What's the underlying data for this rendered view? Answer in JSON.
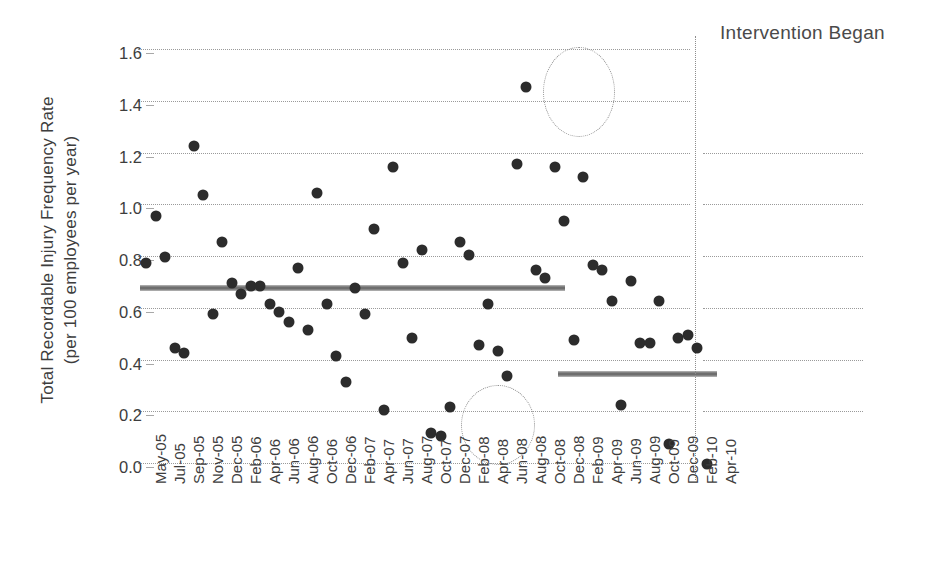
{
  "chart_data": {
    "type": "scatter",
    "title": "",
    "xlabel": "",
    "ylabel_line1": "Total Recordable Injury Frequency Rate",
    "ylabel_line2": "(per 100 employees per year)",
    "ylim": [
      0.0,
      1.6
    ],
    "yticks": [
      0.0,
      0.2,
      0.4,
      0.6,
      0.8,
      1.0,
      1.2,
      1.4,
      1.6
    ],
    "ytick_labels": [
      "0.0",
      "0.2",
      "0.4",
      "0.6",
      "0.8",
      "1.0",
      "1.2",
      "1.4",
      "1.6"
    ],
    "grid": "horizontal-dotted",
    "legend": "none",
    "xtick_labels": [
      "May-05",
      "Jul-05",
      "Sep-05",
      "Nov-05",
      "Dec-05",
      "Feb-06",
      "Apr-06",
      "Jun-06",
      "Aug-06",
      "Oct-06",
      "Dec-06",
      "Feb-07",
      "Apr-07",
      "Jun-07",
      "Aug-07",
      "Oct-07",
      "Dec-07",
      "Feb-08",
      "Apr-08",
      "Jun-08",
      "Aug-08",
      "Oct-08",
      "Dec-08",
      "Feb-09",
      "Apr-09",
      "Jun-09",
      "Aug-09",
      "Oct-09",
      "Dec-09",
      "Feb-10",
      "Apr-10"
    ],
    "x": [
      0,
      1,
      2,
      3,
      4,
      5,
      6,
      7,
      8,
      9,
      10,
      11,
      12,
      13,
      14,
      15,
      16,
      17,
      18,
      19,
      20,
      21,
      22,
      23,
      24,
      25,
      26,
      27,
      28,
      29,
      30,
      31,
      32,
      33,
      34,
      35,
      36,
      37,
      38,
      39,
      40,
      41,
      42,
      43,
      44,
      45,
      46,
      47,
      48,
      49,
      50,
      51,
      52,
      53,
      54,
      55,
      56,
      57,
      58,
      59
    ],
    "values": [
      0.79,
      0.97,
      0.81,
      0.46,
      0.44,
      1.24,
      1.05,
      0.59,
      0.87,
      0.71,
      0.67,
      0.7,
      0.7,
      0.63,
      0.6,
      0.56,
      0.77,
      0.53,
      1.06,
      0.63,
      0.43,
      0.33,
      0.69,
      0.59,
      0.92,
      0.22,
      1.16,
      0.79,
      0.5,
      0.84,
      0.13,
      0.12,
      0.23,
      0.87,
      0.82,
      0.47,
      0.63,
      0.45,
      0.35,
      1.17,
      1.47,
      0.76,
      0.73,
      1.16,
      0.95,
      0.49,
      1.12,
      0.78,
      0.76,
      0.64,
      0.24,
      0.72,
      0.48,
      0.48,
      0.64,
      0.09,
      0.5,
      0.51,
      0.46,
      0.01
    ],
    "series_note": "Monthly total recordable injury frequency rate",
    "mean_lines": [
      {
        "name": "pre-intervention-mean",
        "value": 0.69,
        "x_start": 0,
        "x_end": 43
      },
      {
        "name": "post-intervention-mean",
        "value": 0.36,
        "x_start": 44,
        "x_end": 59
      }
    ],
    "annotations": [
      {
        "name": "intervention-began",
        "text": "Intervention Began",
        "type": "vertical-line-label"
      }
    ],
    "highlight_circles": [
      {
        "name": "high-outlier-circle",
        "center_value": 1.47
      },
      {
        "name": "low-outlier-circle",
        "center_value": 0.16
      }
    ],
    "colors": {
      "dot": "#2c2c2c",
      "mean_line": "#6e6e6e",
      "grid": "#9a9a9a",
      "text": "#3d3d3d"
    }
  }
}
